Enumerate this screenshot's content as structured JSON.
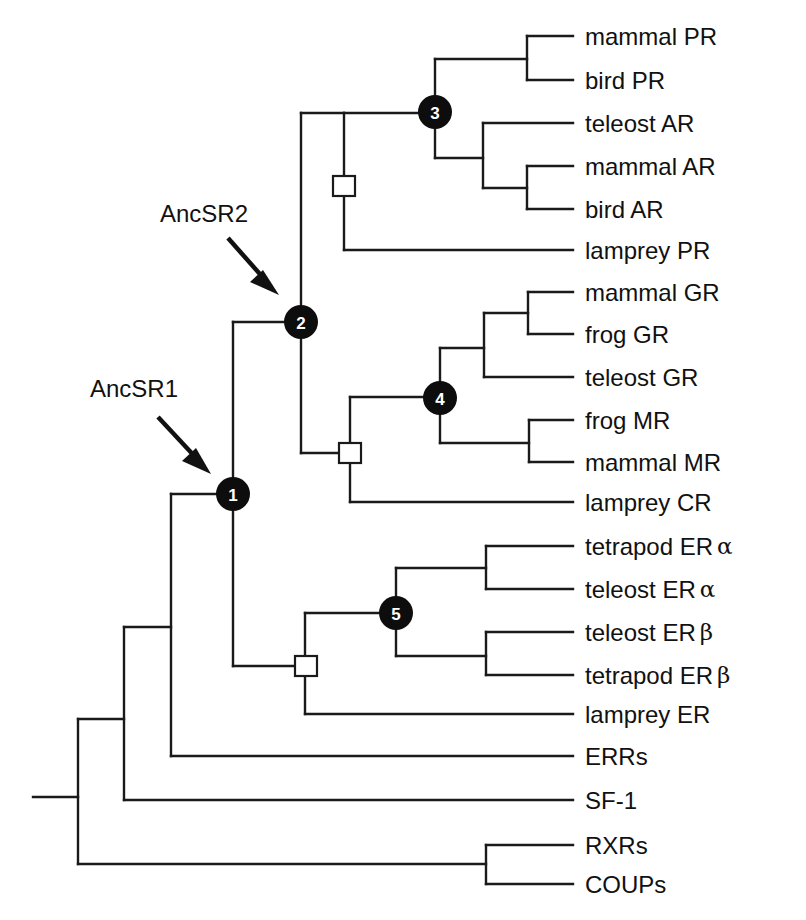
{
  "figure": {
    "type": "phylogenetic-tree"
  },
  "annotations": {
    "ancsr1": {
      "label": "AncSR1",
      "points_to_node": "1"
    },
    "ancsr2": {
      "label": "AncSR2",
      "points_to_node": "2"
    }
  },
  "leaves": [
    {
      "id": "mammal_pr",
      "label": "mammal PR",
      "y": 36
    },
    {
      "id": "bird_pr",
      "label": "bird PR",
      "y": 80
    },
    {
      "id": "teleost_ar",
      "label": "teleost AR",
      "y": 123
    },
    {
      "id": "mammal_ar",
      "label": "mammal AR",
      "y": 166
    },
    {
      "id": "bird_ar",
      "label": "bird AR",
      "y": 209
    },
    {
      "id": "lamprey_pr",
      "label": "lamprey PR",
      "y": 250
    },
    {
      "id": "mammal_gr",
      "label": "mammal GR",
      "y": 292
    },
    {
      "id": "frog_gr",
      "label": "frog GR",
      "y": 334
    },
    {
      "id": "teleost_gr",
      "label": "teleost GR",
      "y": 377
    },
    {
      "id": "frog_mr",
      "label": "frog MR",
      "y": 420
    },
    {
      "id": "mammal_mr",
      "label": "mammal MR",
      "y": 462
    },
    {
      "id": "lamprey_cr",
      "label": "lamprey CR",
      "y": 502
    },
    {
      "id": "tetrapod_er_alpha",
      "label": "tetrapod ER",
      "greek": "α",
      "y": 546
    },
    {
      "id": "teleost_er_alpha",
      "label": "teleost ER",
      "greek": "α",
      "y": 589
    },
    {
      "id": "teleost_er_beta",
      "label": "teleost ER",
      "greek": "β",
      "y": 632
    },
    {
      "id": "tetrapod_er_beta",
      "label": "tetrapod ER",
      "greek": "β",
      "y": 675
    },
    {
      "id": "lamprey_er",
      "label": "lamprey ER",
      "y": 714
    },
    {
      "id": "errs",
      "label": "ERRs",
      "y": 756
    },
    {
      "id": "sf1",
      "label": "SF-1",
      "y": 800
    },
    {
      "id": "rxrs",
      "label": "RXRs",
      "y": 845
    },
    {
      "id": "coups",
      "label": "COUPs",
      "y": 884
    }
  ],
  "numbered_nodes": [
    {
      "number": "1",
      "x": 233,
      "y": 494
    },
    {
      "number": "2",
      "x": 301,
      "y": 322
    },
    {
      "number": "3",
      "x": 435,
      "y": 112
    },
    {
      "number": "4",
      "x": 440,
      "y": 398
    },
    {
      "number": "5",
      "x": 396,
      "y": 613
    }
  ],
  "duplication_nodes": [
    {
      "x": 344,
      "y": 186
    },
    {
      "x": 350,
      "y": 453
    },
    {
      "x": 306,
      "y": 666
    }
  ],
  "leaf_x": 573,
  "label_x": 585,
  "branches": [
    "M33 797 H78",
    "M78 719 V864",
    "M78 719 H124",
    "M78 864 H486",
    "M486 845 V884",
    "M486 845 H573",
    "M486 884 H573",
    "M124 627 V800",
    "M124 800 H573",
    "M124 627 H171",
    "M171 494 V756",
    "M171 756 H573",
    "M171 494 H233",
    "M233 322 V666",
    "M233 322 H301",
    "M233 666 H306",
    "M305 613 V714",
    "M305 714 H573",
    "M305 613 H396",
    "M396 568 V656",
    "M396 568 H486",
    "M396 656 H486",
    "M486 546 V589",
    "M486 546 H573",
    "M486 589 H573",
    "M486 632 V675",
    "M486 632 H573",
    "M486 675 H573",
    "M301 113 V453",
    "M301 113 H344",
    "M301 453 H350",
    "M344 113 V250",
    "M344 250 H573",
    "M344 113 H435",
    "M435 59 V158",
    "M435 59 H527",
    "M435 158 H483",
    "M527 36 V80",
    "M527 36 H573",
    "M527 80 H573",
    "M483 123 V188",
    "M483 123 H573",
    "M483 188 H527",
    "M527 166 V209",
    "M527 166 H573",
    "M527 209 H573",
    "M350 397 V502",
    "M350 502 H573",
    "M350 397 H440",
    "M440 348 V443",
    "M440 348 H484",
    "M440 443 H529",
    "M484 313 V377",
    "M484 377 H573",
    "M484 313 H528",
    "M528 292 V334",
    "M528 292 H573",
    "M528 334 H573",
    "M529 420 V462",
    "M529 420 H573",
    "M529 462 H573"
  ]
}
